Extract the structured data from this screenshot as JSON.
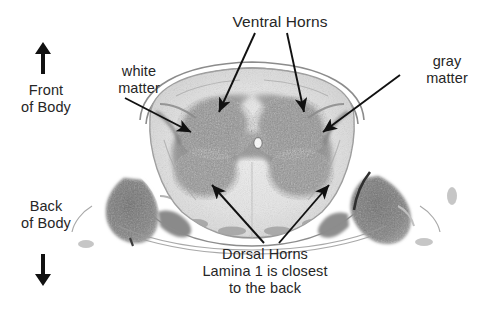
{
  "figure": {
    "text_color": "#262626",
    "background": "#ffffff"
  },
  "labels": {
    "ventral_horns": "Ventral Horns",
    "gray_matter": "gray\nmatter",
    "white_matter": "white\nmatter",
    "dorsal_block": "Dorsal Horns\nLamina 1 is closest\nto the back",
    "front_of_body": "Front\nof Body",
    "back_of_body": "Back\nof Body"
  },
  "orientation": {
    "up_arrow": "up-arrow-icon",
    "down_arrow": "down-arrow-icon"
  },
  "pointers": [
    {
      "name": "ventral-horn-left",
      "from": [
        255,
        33
      ],
      "to": [
        218,
        113
      ]
    },
    {
      "name": "ventral-horn-right",
      "from": [
        287,
        33
      ],
      "to": [
        305,
        113
      ]
    },
    {
      "name": "gray-matter",
      "from": [
        400,
        75
      ],
      "to": [
        322,
        133
      ]
    },
    {
      "name": "white-matter",
      "from": [
        125,
        98
      ],
      "to": [
        192,
        133
      ]
    },
    {
      "name": "dorsal-horn-left",
      "from": [
        264,
        243
      ],
      "to": [
        211,
        184
      ]
    },
    {
      "name": "dorsal-horn-right",
      "from": [
        279,
        243
      ],
      "to": [
        330,
        184
      ]
    }
  ]
}
